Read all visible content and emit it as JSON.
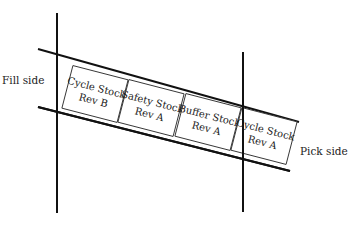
{
  "diagram": {
    "type": "flow-rack-lane",
    "colors": {
      "line": "#111111",
      "box_stroke": "#333333",
      "text": "#222222",
      "background": "#ffffff"
    },
    "labels": {
      "fill_side": "Fill side",
      "pick_side": "Pick side"
    },
    "boxes": [
      {
        "line1": "Cycle Stock",
        "line2": "Rev B"
      },
      {
        "line1": "Safety Stock",
        "line2": "Rev A"
      },
      {
        "line1": "Buffer Stock",
        "line2": "Rev A"
      },
      {
        "line1": "Cycle Stock",
        "line2": "Rev A"
      }
    ]
  }
}
